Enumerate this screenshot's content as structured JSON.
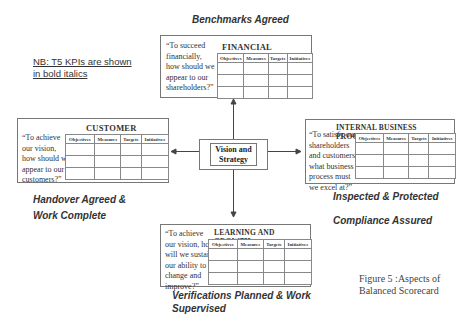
{
  "note": {
    "line1": "NB: T5 KPIs are shown",
    "line2": "in bold italics"
  },
  "labels": {
    "top": "Benchmarks Agreed",
    "left_line1": "Handover Agreed &",
    "left_line2": "Work Complete",
    "right_line1": "Inspected & Protected",
    "right_line2": "Compliance Assured",
    "bottom_line1": "Verifications Planned & Work",
    "bottom_line2": "Supervised"
  },
  "columns": [
    "Objectives",
    "Measures",
    "Targets",
    "Initiatives"
  ],
  "financial": {
    "title": "FINANCIAL",
    "question": [
      "“To succeed",
      "financially,",
      "how should we",
      "appear to our",
      "shareholders?”"
    ]
  },
  "customer": {
    "title": "CUSTOMER",
    "question": [
      "“To achieve",
      "our vision,",
      "how should we",
      "appear to our",
      "customers?”"
    ]
  },
  "internal": {
    "title": "INTERNAL BUSINESS PROCESS",
    "question": [
      "“To satisfy our",
      "shareholders",
      "and customers,",
      "what business",
      "process must",
      "we excel at?”"
    ]
  },
  "learning": {
    "title": "LEARNING AND GROWTH",
    "question": [
      "“To achieve",
      "our vision, how",
      "will we sustain",
      "our ability to",
      "change and",
      "improve?”"
    ]
  },
  "vision": {
    "line1": "Vision and",
    "line2": "Strategy"
  },
  "caption": {
    "line1": "Figure 5 :Aspects of",
    "line2": "Balanced Scorecard"
  }
}
